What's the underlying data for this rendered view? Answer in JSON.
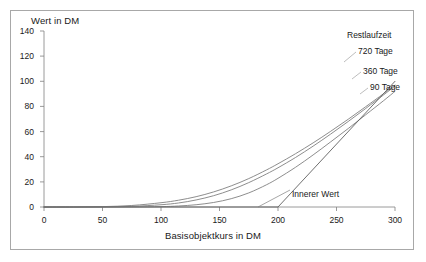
{
  "chart_data": {
    "type": "line",
    "title": "",
    "xlabel": "Basisobjektkurs in DM",
    "ylabel": "Wert in DM",
    "xlim": [
      0,
      300
    ],
    "ylim": [
      0,
      140
    ],
    "xticks": [
      0,
      50,
      100,
      150,
      200,
      250,
      300
    ],
    "yticks": [
      0,
      20,
      40,
      60,
      80,
      100,
      120,
      140
    ],
    "grid": false,
    "legend_position": "top-right-inline",
    "legend_title": "Restlaufzeit",
    "annotations": [
      {
        "text": "Innerer Wert",
        "x": 200,
        "y": 0
      }
    ],
    "series": [
      {
        "name": "720 Tage",
        "color": "#808080",
        "x": [
          0,
          25,
          50,
          75,
          100,
          115,
          130,
          145,
          160,
          175,
          190,
          200,
          215,
          230,
          245,
          260,
          275,
          290,
          300
        ],
        "y": [
          0,
          0,
          0.3,
          1.2,
          3.4,
          5.4,
          8.2,
          12.0,
          16.8,
          22.6,
          29.4,
          34.4,
          42.4,
          51.0,
          60.2,
          69.8,
          79.8,
          90.0,
          97.0
        ]
      },
      {
        "name": "360 Tage",
        "color": "#808080",
        "x": [
          0,
          25,
          50,
          75,
          100,
          115,
          130,
          145,
          160,
          175,
          190,
          200,
          215,
          230,
          245,
          260,
          275,
          290,
          300
        ],
        "y": [
          0,
          0,
          0.1,
          0.5,
          1.8,
          3.2,
          5.6,
          9.0,
          13.6,
          19.4,
          26.2,
          31.2,
          39.4,
          48.4,
          58.0,
          68.0,
          78.4,
          89.0,
          96.2
        ]
      },
      {
        "name": "90 Tage",
        "color": "#808080",
        "x": [
          0,
          25,
          50,
          75,
          100,
          115,
          130,
          145,
          160,
          175,
          190,
          200,
          215,
          230,
          245,
          260,
          275,
          290,
          300
        ],
        "y": [
          0,
          0,
          0,
          0.05,
          0.3,
          0.8,
          1.8,
          3.6,
          6.6,
          11.2,
          17.6,
          22.8,
          31.6,
          41.4,
          51.8,
          62.4,
          73.4,
          84.4,
          92.0
        ]
      },
      {
        "name": "Innerer Wert",
        "color": "#606060",
        "x": [
          0,
          200,
          300
        ],
        "y": [
          0,
          0,
          100
        ]
      }
    ]
  },
  "axes": {
    "y_title": "Wert in DM",
    "x_title": "Basisobjektkurs in DM",
    "y_tick_labels": [
      "0",
      "20",
      "40",
      "60",
      "80",
      "100",
      "120",
      "140"
    ],
    "x_tick_labels": [
      "0",
      "50",
      "100",
      "150",
      "200",
      "250",
      "300"
    ]
  },
  "legend": {
    "title": "Restlaufzeit",
    "items": [
      "720 Tage",
      "360 Tage",
      "90 Tage"
    ]
  },
  "annotation": {
    "innerer_wert": "Innerer Wert"
  },
  "colors": {
    "frame": "#a8a8a8",
    "axis": "#808080",
    "curve": "#808080",
    "text": "#1a1a1a",
    "background": "#ffffff"
  }
}
